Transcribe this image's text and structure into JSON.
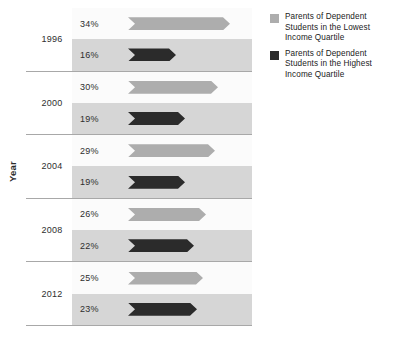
{
  "chart_data": {
    "type": "bar",
    "orientation": "horizontal",
    "title": "",
    "subtitle": "",
    "xlabel": "",
    "ylabel": "Year",
    "grid": false,
    "legend_position": "right",
    "categories": [
      "1996",
      "2000",
      "2004",
      "2008",
      "2012"
    ],
    "value_suffix": "%",
    "xlim": [
      0,
      40
    ],
    "series": [
      {
        "name": "Parents of Dependent Students in the Lowest Income Quartile",
        "color": "#adadad",
        "values": [
          34,
          30,
          29,
          26,
          25
        ],
        "labels": [
          "34%",
          "30%",
          "29%",
          "26%",
          "25%"
        ]
      },
      {
        "name": "Parents of Dependent Students in the Highest Income Quartile",
        "color": "#2b2b2b",
        "values": [
          16,
          19,
          19,
          22,
          23
        ],
        "labels": [
          "16%",
          "19%",
          "19%",
          "22%",
          "23%"
        ]
      }
    ]
  },
  "axis": {
    "y_title": "Year"
  },
  "groups": [
    {
      "year": "1996",
      "bars": [
        {
          "label": "34%",
          "value": 34,
          "series": "lowest"
        },
        {
          "label": "16%",
          "value": 16,
          "series": "highest"
        }
      ]
    },
    {
      "year": "2000",
      "bars": [
        {
          "label": "30%",
          "value": 30,
          "series": "lowest"
        },
        {
          "label": "19%",
          "value": 19,
          "series": "highest"
        }
      ]
    },
    {
      "year": "2004",
      "bars": [
        {
          "label": "29%",
          "value": 29,
          "series": "lowest"
        },
        {
          "label": "19%",
          "value": 19,
          "series": "highest"
        }
      ]
    },
    {
      "year": "2008",
      "bars": [
        {
          "label": "26%",
          "value": 26,
          "series": "lowest"
        },
        {
          "label": "22%",
          "value": 22,
          "series": "highest"
        }
      ]
    },
    {
      "year": "2012",
      "bars": [
        {
          "label": "25%",
          "value": 25,
          "series": "lowest"
        },
        {
          "label": "23%",
          "value": 23,
          "series": "highest"
        }
      ]
    }
  ],
  "legend": {
    "items": [
      {
        "label": "Parents of Dependent Students in the Lowest Income Quartile",
        "color": "#adadad",
        "series": "lowest"
      },
      {
        "label": "Parents of Dependent Students in the Highest Income Quartile",
        "color": "#2b2b2b",
        "series": "highest"
      }
    ]
  },
  "colors": {
    "series_lowest": "#adadad",
    "series_highest": "#2b2b2b",
    "row_light": "#fbfbfb",
    "row_dark": "#d6d6d6",
    "separator": "#a8a8a8",
    "text": "#2b2b2b",
    "background": "#ffffff"
  }
}
